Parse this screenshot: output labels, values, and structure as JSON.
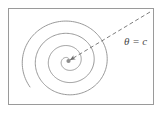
{
  "figure": {
    "background_color": "#ffffff",
    "frame": {
      "name": "figure-frame",
      "stroke_color": "#9a9a9a",
      "x": 8,
      "y": 8,
      "width": 146,
      "height": 97
    },
    "spiral": {
      "name": "archimedean-spiral",
      "stroke_color": "#8d8d8d",
      "center_x": 68,
      "center_y": 61,
      "turns": 3.6,
      "max_radius": 47,
      "start_angle_deg": 0,
      "direction": "counterclockwise"
    },
    "ray": {
      "name": "theta-equals-c-ray",
      "style": "dashed",
      "stroke_color": "#6f6f6f",
      "from_x": 150,
      "from_y": 12,
      "to_x": 70,
      "to_y": 60,
      "arrowhead": "at-spiral-center"
    },
    "labels": {
      "theta_equals_c": "θ = c"
    }
  }
}
